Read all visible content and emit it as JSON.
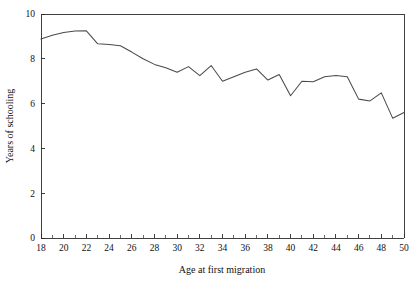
{
  "chart_data": {
    "type": "line",
    "title": "",
    "subtitle": "",
    "xlabel": "Age at first migration",
    "ylabel": "Years of schooling",
    "xlim": [
      18,
      50
    ],
    "ylim": [
      0,
      10
    ],
    "grid": false,
    "legend": null,
    "legend_position": "none",
    "x_major_ticks": [
      18,
      20,
      22,
      24,
      26,
      28,
      30,
      32,
      34,
      36,
      38,
      40,
      42,
      44,
      46,
      48,
      50
    ],
    "x_minor_tick_step": 1,
    "y_major_ticks": [
      0,
      2,
      4,
      6,
      8,
      10
    ],
    "x_tick_labels": [
      "18",
      "20",
      "22",
      "24",
      "26",
      "28",
      "30",
      "32",
      "34",
      "36",
      "38",
      "40",
      "42",
      "44",
      "46",
      "48",
      "50"
    ],
    "y_tick_labels": [
      "0",
      "2",
      "4",
      "6",
      "8",
      "10"
    ],
    "line_color": "#4a4a4a",
    "axis_color": "#2b2b2b",
    "background_color": "#ffffff",
    "x": [
      18,
      19,
      20,
      21,
      22,
      23,
      24,
      25,
      26,
      27,
      28,
      29,
      30,
      31,
      32,
      33,
      34,
      35,
      36,
      37,
      38,
      39,
      40,
      41,
      42,
      43,
      44,
      45,
      46,
      47,
      48,
      49,
      50
    ],
    "values": [
      8.88,
      9.05,
      9.17,
      9.24,
      9.25,
      8.67,
      8.64,
      8.58,
      8.3,
      8.0,
      7.75,
      7.6,
      7.4,
      7.65,
      7.25,
      7.7,
      7.0,
      7.2,
      7.4,
      7.55,
      7.05,
      7.3,
      6.35,
      7.0,
      6.98,
      7.2,
      7.25,
      7.2,
      6.2,
      6.12,
      6.48,
      5.35,
      5.6
    ],
    "series": [
      {
        "name": "Years of schooling",
        "values": [
          8.88,
          9.05,
          9.17,
          9.24,
          9.25,
          8.67,
          8.64,
          8.58,
          8.3,
          8.0,
          7.75,
          7.6,
          7.4,
          7.65,
          7.25,
          7.7,
          7.0,
          7.2,
          7.4,
          7.55,
          7.05,
          7.3,
          6.35,
          7.0,
          6.98,
          7.2,
          7.25,
          7.2,
          6.2,
          6.12,
          6.48,
          5.35,
          5.6
        ]
      }
    ]
  }
}
